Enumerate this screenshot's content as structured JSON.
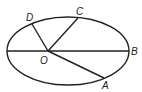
{
  "diagram": {
    "type": "ellipse-geometry",
    "ellipse": {
      "cx": 68,
      "cy": 51,
      "rx": 61,
      "ry": 34
    },
    "points": {
      "O": {
        "label": "O",
        "x": 48,
        "y": 51
      },
      "A": {
        "label": "A",
        "x": 104,
        "y": 78
      },
      "B": {
        "label": "B",
        "x": 129,
        "y": 51
      },
      "C": {
        "label": "C",
        "x": 78,
        "y": 18
      },
      "D": {
        "label": "D",
        "x": 32,
        "y": 24
      }
    },
    "segments": [
      {
        "from": "left-edge",
        "to": "B",
        "name": "horizontal-axis"
      },
      {
        "from": "O",
        "to": "D"
      },
      {
        "from": "O",
        "to": "C"
      },
      {
        "from": "O",
        "to": "A"
      }
    ],
    "labels": {
      "D": "D",
      "C": "C",
      "O": "O",
      "B": "B",
      "A": "A"
    }
  }
}
